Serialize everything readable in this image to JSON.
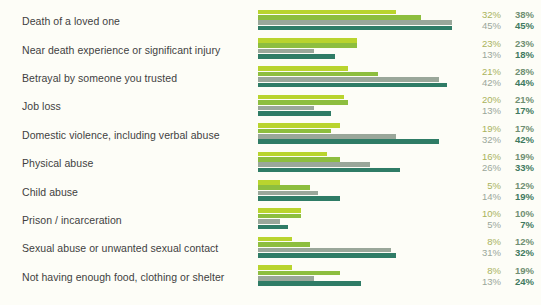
{
  "chart_data": {
    "type": "bar",
    "title": "",
    "subtitle": "",
    "xlabel": "",
    "ylabel": "",
    "orientation": "horizontal",
    "grid": false,
    "legend_position": "none",
    "xlim": [
      0,
      50
    ],
    "value_suffix": "%",
    "categories": [
      "Death of a loved one",
      "Near death experience or significant injury",
      "Betrayal by someone you trusted",
      "Job loss",
      "Domestic violence, including verbal abuse",
      "Physical abuse",
      "Child abuse",
      "Prison / incarceration",
      "Sexual abuse or unwanted sexual contact",
      "Not having enough food, clothing or shelter"
    ],
    "series": [
      {
        "name": "series-1",
        "color": "#b9d42e",
        "values": [
          32,
          23,
          21,
          20,
          19,
          16,
          5,
          10,
          8,
          8
        ]
      },
      {
        "name": "series-2",
        "color": "#8dbe3f",
        "values": [
          38,
          23,
          28,
          21,
          17,
          19,
          12,
          10,
          12,
          19
        ]
      },
      {
        "name": "series-3",
        "color": "#9aa79a",
        "values": [
          45,
          13,
          42,
          13,
          32,
          26,
          14,
          5,
          31,
          13
        ]
      },
      {
        "name": "series-4",
        "color": "#2f7c66",
        "values": [
          45,
          18,
          44,
          17,
          42,
          33,
          19,
          7,
          32,
          24
        ]
      }
    ],
    "value_labels": [
      {
        "left": "32%",
        "right": "38%"
      },
      {
        "left": "45%",
        "right": "45%"
      },
      {
        "left": "23%",
        "right": "23%"
      },
      {
        "left": "13%",
        "right": "18%"
      },
      {
        "left": "21%",
        "right": "28%"
      },
      {
        "left": "42%",
        "right": "44%"
      },
      {
        "left": "20%",
        "right": "21%"
      },
      {
        "left": "13%",
        "right": "17%"
      },
      {
        "left": "19%",
        "right": "17%"
      },
      {
        "left": "32%",
        "right": "42%"
      },
      {
        "left": "16%",
        "right": "19%"
      },
      {
        "left": "26%",
        "right": "33%"
      },
      {
        "left": "5%",
        "right": "12%"
      },
      {
        "left": "14%",
        "right": "19%"
      },
      {
        "left": "10%",
        "right": "10%"
      },
      {
        "left": "5%",
        "right": "7%"
      },
      {
        "left": "8%",
        "right": "12%"
      },
      {
        "left": "31%",
        "right": "32%"
      },
      {
        "left": "8%",
        "right": "19%"
      },
      {
        "left": "13%",
        "right": "24%"
      }
    ]
  },
  "colors": {
    "background": "#fdfdf7",
    "series_1": "#b9d42e",
    "series_2": "#8dbe3f",
    "series_3": "#9aa79a",
    "series_4": "#2f7c66",
    "label_text": "#3f3f3f",
    "value_light": "#a9b35c",
    "value_dark": "#3f7a60"
  }
}
